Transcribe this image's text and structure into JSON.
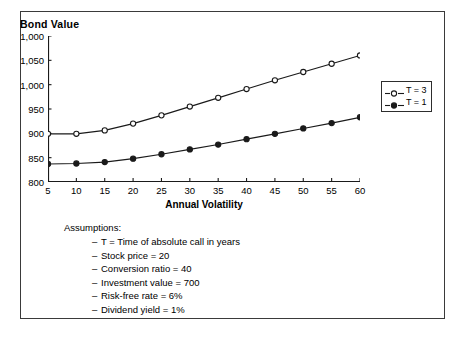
{
  "figure": {
    "title": "Bond Value"
  },
  "chart_data": {
    "type": "line",
    "title": "Bond Value",
    "xlabel": "Annual Volatility",
    "ylabel": "Bond Value",
    "x": [
      5,
      10,
      15,
      20,
      25,
      30,
      35,
      40,
      45,
      50,
      55,
      60
    ],
    "xtick_labels": [
      "5",
      "10",
      "15",
      "20",
      "25",
      "30",
      "35",
      "40",
      "45",
      "50",
      "55",
      "60"
    ],
    "ytick_labels": [
      "1,000",
      "1,050",
      "1,000",
      "950",
      "900",
      "850",
      "800"
    ],
    "ytick_values": [
      1100,
      1050,
      1000,
      950,
      900,
      850,
      800
    ],
    "xlim": [
      5,
      60
    ],
    "ylim": [
      800,
      1100
    ],
    "grid": false,
    "legend_position": "right",
    "series": [
      {
        "name": "T = 3",
        "marker": "open-circle",
        "values": [
          899,
          899,
          906,
          920,
          937,
          955,
          973,
          991,
          1009,
          1026,
          1043,
          1060
        ]
      },
      {
        "name": "T = 1",
        "marker": "filled-circle",
        "values": [
          837,
          838,
          841,
          848,
          857,
          867,
          877,
          888,
          899,
          910,
          921,
          933
        ]
      }
    ]
  },
  "legend": {
    "items": [
      {
        "label": "T = 3",
        "marker": "open-circle"
      },
      {
        "label": "T = 1",
        "marker": "filled-circle"
      }
    ]
  },
  "assumptions": {
    "heading": "Assumptions:",
    "items": [
      "T = Time of absolute call in years",
      "Stock price = 20",
      "Conversion ratio = 40",
      "Investment value = 700",
      "Risk-free rate = 6%",
      "Dividend yield = 1%"
    ]
  },
  "colors": {
    "line": "#1a1a1a",
    "axis": "#1a1a1a",
    "frame": "#3a3a3a",
    "background": "#ffffff"
  }
}
